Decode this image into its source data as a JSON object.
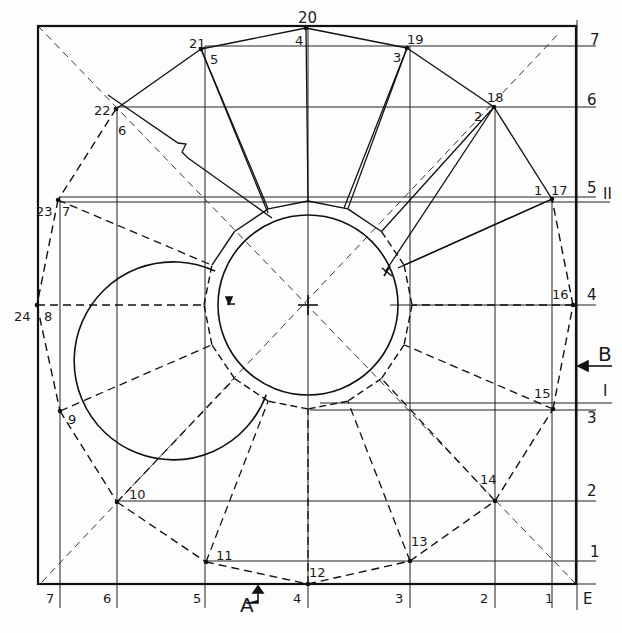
{
  "drawing": {
    "type": "sheet-metal development layout (plan view, 24-point division)",
    "colors": {
      "ink": "#1e1e1e",
      "paper": "#fdfdfd"
    },
    "frame": {
      "left": 38,
      "top": 26,
      "right": 576,
      "bottom": 584
    },
    "center": {
      "x": 308,
      "y": 305
    },
    "circle_radii": {
      "inner": 90,
      "ring": 99,
      "polygon": 104
    },
    "vertical_lines": [
      {
        "label": "7",
        "x": 60
      },
      {
        "label": "6",
        "x": 117
      },
      {
        "label": "5",
        "x": 205
      },
      {
        "label": "4",
        "x": 308
      },
      {
        "label": "3",
        "x": 410
      },
      {
        "label": "2",
        "x": 495
      },
      {
        "label": "1",
        "x": 552
      },
      {
        "label": "E",
        "x": 577
      }
    ],
    "horizontal_lines": [
      {
        "label": "7",
        "y": 46
      },
      {
        "label": "6",
        "y": 107
      },
      {
        "label": "5",
        "y": 197
      },
      {
        "label": "II",
        "y": 202
      },
      {
        "label": "4",
        "y": 305
      },
      {
        "label": "I",
        "y": 403
      },
      {
        "label": "3",
        "y": 410
      },
      {
        "label": "2",
        "y": 501
      },
      {
        "label": "1",
        "y": 561
      }
    ],
    "points": [
      {
        "id": "12",
        "x": 308,
        "y": 584
      },
      {
        "id": "13",
        "x": 410,
        "y": 561
      },
      {
        "id": "14",
        "x": 495,
        "y": 501
      },
      {
        "id": "15",
        "x": 553,
        "y": 409
      },
      {
        "id": "16",
        "x": 573,
        "y": 305
      },
      {
        "id": "17",
        "x": 552,
        "y": 199
      },
      {
        "id": "18",
        "x": 494,
        "y": 107
      },
      {
        "id": "19",
        "x": 407,
        "y": 48
      },
      {
        "id": "20",
        "x": 306,
        "y": 28
      },
      {
        "id": "21",
        "x": 201,
        "y": 49
      },
      {
        "id": "22",
        "x": 116,
        "y": 109
      },
      {
        "id": "23",
        "x": 58,
        "y": 200
      },
      {
        "id": "24",
        "x": 37,
        "y": 305
      },
      {
        "id": "9",
        "x": 60,
        "y": 411
      },
      {
        "id": "10",
        "x": 117,
        "y": 502
      },
      {
        "id": "11",
        "x": 206,
        "y": 562
      }
    ],
    "labels": {
      "point_numbers": [
        {
          "text": "20",
          "x": 298,
          "y": 11,
          "size": "med"
        },
        {
          "text": "4",
          "x": 295,
          "y": 34
        },
        {
          "text": "21",
          "x": 189,
          "y": 37
        },
        {
          "text": "5",
          "x": 210,
          "y": 53
        },
        {
          "text": "19",
          "x": 407,
          "y": 33
        },
        {
          "text": "3",
          "x": 393,
          "y": 51
        },
        {
          "text": "22",
          "x": 94,
          "y": 104
        },
        {
          "text": "6",
          "x": 118,
          "y": 124
        },
        {
          "text": "18",
          "x": 487,
          "y": 91
        },
        {
          "text": "2",
          "x": 474,
          "y": 110
        },
        {
          "text": "23",
          "x": 36,
          "y": 205
        },
        {
          "text": "7",
          "x": 62,
          "y": 205
        },
        {
          "text": "1",
          "x": 534,
          "y": 184
        },
        {
          "text": "17",
          "x": 551,
          "y": 184
        },
        {
          "text": "24",
          "x": 14,
          "y": 310
        },
        {
          "text": "8",
          "x": 44,
          "y": 310
        },
        {
          "text": "16",
          "x": 552,
          "y": 288
        },
        {
          "text": "9",
          "x": 68,
          "y": 413
        },
        {
          "text": "15",
          "x": 534,
          "y": 387
        },
        {
          "text": "10",
          "x": 129,
          "y": 488
        },
        {
          "text": "14",
          "x": 480,
          "y": 473
        },
        {
          "text": "11",
          "x": 216,
          "y": 549
        },
        {
          "text": "13",
          "x": 411,
          "y": 535
        },
        {
          "text": "12",
          "x": 309,
          "y": 566
        }
      ],
      "bottom_scale": [
        "7",
        "6",
        "5",
        "4",
        "3",
        "2",
        "1",
        "E"
      ],
      "right_scale": [
        "7",
        "6",
        "5",
        "II",
        "4",
        "B",
        "I",
        "3",
        "2",
        "1"
      ],
      "section_marks": {
        "A": "A",
        "B": "B"
      }
    }
  }
}
